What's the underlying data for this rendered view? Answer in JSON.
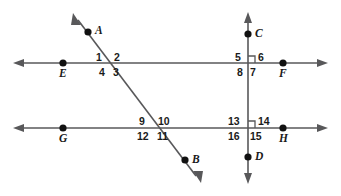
{
  "diagram": {
    "type": "geometry-transversal-parallel-lines",
    "background_color": "#ffffff",
    "line_color": "#58585a",
    "label_color": "#1a1a1a",
    "point_color": "#111111",
    "points": [
      {
        "id": "A",
        "label": "A",
        "x": 88,
        "y": 32,
        "label_x": 95,
        "label_y": 25
      },
      {
        "id": "B",
        "label": "B",
        "x": 185,
        "y": 160,
        "label_x": 192,
        "label_y": 154
      },
      {
        "id": "C",
        "label": "C",
        "x": 248,
        "y": 34,
        "label_x": 255,
        "label_y": 28
      },
      {
        "id": "D",
        "label": "D",
        "x": 248,
        "y": 157,
        "label_x": 255,
        "label_y": 151
      },
      {
        "id": "E",
        "label": "E",
        "x": 63,
        "y": 63,
        "label_x": 59,
        "label_y": 68
      },
      {
        "id": "F",
        "label": "F",
        "x": 283,
        "y": 63,
        "label_x": 279,
        "label_y": 68
      },
      {
        "id": "G",
        "label": "G",
        "x": 63,
        "y": 128,
        "label_x": 59,
        "label_y": 133
      },
      {
        "id": "H",
        "label": "H",
        "x": 283,
        "y": 128,
        "label_x": 279,
        "label_y": 133
      }
    ],
    "lines": [
      {
        "id": "line-EF",
        "name": "top-horizontal-line",
        "x1": 14,
        "y1": 63,
        "x2": 327,
        "y2": 63,
        "arrows": "both"
      },
      {
        "id": "line-GH",
        "name": "bottom-horizontal-line",
        "x1": 14,
        "y1": 128,
        "x2": 327,
        "y2": 128,
        "arrows": "both"
      },
      {
        "id": "line-AB",
        "name": "transversal-line",
        "x1": 74,
        "y1": 15,
        "x2": 200,
        "y2": 181,
        "arrows": "both"
      },
      {
        "id": "line-CD",
        "name": "vertical-line",
        "x1": 248,
        "y1": 13,
        "x2": 248,
        "y2": 183,
        "arrows": "both"
      }
    ],
    "intersections": [
      {
        "id": "int-top-left",
        "x": 111,
        "y": 63,
        "right_angle": false
      },
      {
        "id": "int-top-right",
        "x": 248,
        "y": 63,
        "right_angle": true
      },
      {
        "id": "int-bottom-left",
        "x": 156,
        "y": 128,
        "right_angle": false
      },
      {
        "id": "int-bottom-right",
        "x": 248,
        "y": 128,
        "right_angle": true
      }
    ],
    "angle_labels": [
      {
        "id": "angle-1",
        "text": "1",
        "x": 96,
        "y": 52
      },
      {
        "id": "angle-2",
        "text": "2",
        "x": 114,
        "y": 52
      },
      {
        "id": "angle-3",
        "text": "3",
        "x": 113,
        "y": 67
      },
      {
        "id": "angle-4",
        "text": "4",
        "x": 99,
        "y": 67
      },
      {
        "id": "angle-5",
        "text": "5",
        "x": 235,
        "y": 52
      },
      {
        "id": "angle-6",
        "text": "6",
        "x": 258,
        "y": 52
      },
      {
        "id": "angle-7",
        "text": "7",
        "x": 250,
        "y": 67
      },
      {
        "id": "angle-8",
        "text": "8",
        "x": 237,
        "y": 67
      },
      {
        "id": "angle-9",
        "text": "9",
        "x": 139,
        "y": 116
      },
      {
        "id": "angle-10",
        "text": "10",
        "x": 158,
        "y": 116
      },
      {
        "id": "angle-11",
        "text": "11",
        "x": 157,
        "y": 131
      },
      {
        "id": "angle-12",
        "text": "12",
        "x": 137,
        "y": 131
      },
      {
        "id": "angle-13",
        "text": "13",
        "x": 228,
        "y": 116
      },
      {
        "id": "angle-14",
        "text": "14",
        "x": 258,
        "y": 116
      },
      {
        "id": "angle-15",
        "text": "15",
        "x": 250,
        "y": 131
      },
      {
        "id": "angle-16",
        "text": "16",
        "x": 228,
        "y": 131
      }
    ]
  }
}
